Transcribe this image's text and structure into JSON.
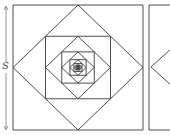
{
  "diagram": {
    "title": "",
    "side_label": "S",
    "colors": {
      "stroke": "#3a3a3a",
      "arrow": "#777777",
      "background": "#ffffff"
    },
    "outer_square": {
      "x": 13,
      "y": 5,
      "w": 130,
      "h": 125
    },
    "nesting_levels": 14,
    "right_square": {
      "x": 149,
      "y": 5,
      "w": 30,
      "h": 125
    }
  }
}
